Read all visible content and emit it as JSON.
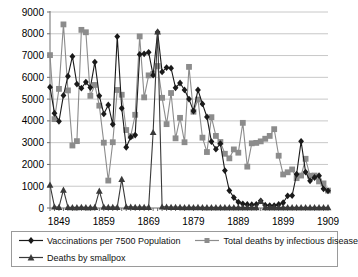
{
  "chart_data": {
    "type": "line",
    "title": "",
    "subtitle": "",
    "xlabel": "",
    "ylabel": "",
    "xlim": [
      1847,
      1909
    ],
    "ylim": [
      0,
      9000
    ],
    "grid": true,
    "legend_position": "bottom",
    "y_ticks": [
      "0",
      "1000",
      "2000",
      "3000",
      "4000",
      "5000",
      "6000",
      "7000",
      "8000",
      "9000"
    ],
    "x_ticks": [
      "1849",
      "1859",
      "1869",
      "1879",
      "1889",
      "1899",
      "1909"
    ],
    "x": [
      1847,
      1848,
      1849,
      1850,
      1851,
      1852,
      1853,
      1854,
      1855,
      1856,
      1857,
      1858,
      1859,
      1860,
      1861,
      1862,
      1863,
      1864,
      1865,
      1866,
      1867,
      1868,
      1869,
      1870,
      1871,
      1872,
      1873,
      1874,
      1875,
      1876,
      1877,
      1878,
      1879,
      1880,
      1881,
      1882,
      1883,
      1884,
      1885,
      1886,
      1887,
      1888,
      1889,
      1890,
      1891,
      1892,
      1893,
      1894,
      1895,
      1896,
      1897,
      1898,
      1899,
      1900,
      1901,
      1902,
      1903,
      1904,
      1905,
      1906,
      1907,
      1908,
      1909
    ],
    "series": [
      {
        "name": "Vaccinations per 7500 Population",
        "color": "#1a1a1a",
        "marker": "diamond",
        "values": [
          5550,
          4350,
          3980,
          5170,
          6050,
          6960,
          5690,
          5500,
          5780,
          5530,
          6700,
          5150,
          4320,
          4730,
          3840,
          7870,
          4580,
          2790,
          3250,
          3350,
          7050,
          7080,
          7150,
          6100,
          8080,
          6250,
          6450,
          6420,
          5520,
          5740,
          5420,
          5000,
          4450,
          5420,
          4780,
          4180,
          3050,
          2700,
          2960,
          1720,
          800,
          480,
          270,
          190,
          160,
          150,
          170,
          330,
          130,
          110,
          110,
          160,
          240,
          560,
          570,
          1550,
          3060,
          1650,
          1250,
          1400,
          1480,
          880,
          790
        ]
      },
      {
        "name": "Total deaths by infectious disease",
        "color": "#8c8c8c",
        "marker": "square",
        "values": [
          7020,
          4080,
          5470,
          8430,
          5400,
          2870,
          3070,
          8180,
          8070,
          5150,
          5650,
          4700,
          3000,
          1260,
          3020,
          5420,
          5200,
          3580,
          3300,
          4280,
          7880,
          5080,
          6090,
          6150,
          6520,
          5060,
          3850,
          5280,
          3200,
          4140,
          3020,
          6480,
          4420,
          4980,
          3230,
          2570,
          4170,
          3310,
          3030,
          2490,
          2280,
          2690,
          2540,
          3910,
          1900,
          2970,
          2990,
          3060,
          3180,
          3310,
          3620,
          2400,
          1540,
          1640,
          1770,
          1370,
          1490,
          2260,
          1480,
          1490,
          1220,
          1130,
          800
        ]
      },
      {
        "name": "Deaths by smallpox",
        "color": "#3a3a3a",
        "marker": "triangle",
        "values": [
          1060,
          60,
          40,
          830,
          40,
          30,
          30,
          40,
          30,
          30,
          40,
          790,
          50,
          40,
          40,
          40,
          1330,
          60,
          50,
          40,
          40,
          40,
          40,
          3480,
          8100,
          60,
          50,
          40,
          40,
          40,
          30,
          40,
          30,
          40,
          30,
          30,
          30,
          30,
          30,
          30,
          30,
          30,
          30,
          30,
          30,
          30,
          30,
          320,
          30,
          30,
          30,
          30,
          30,
          30,
          30,
          30,
          30,
          30,
          30,
          30,
          30,
          30,
          30
        ]
      }
    ]
  },
  "legend": {
    "entries": [
      {
        "label": "Vaccinations per 7500 Population",
        "key": "diamond-line-key"
      },
      {
        "label": "Total deaths by infectious disease",
        "key": "square-line-key"
      },
      {
        "label": "Deaths by smallpox",
        "key": "triangle-line-key"
      }
    ]
  }
}
